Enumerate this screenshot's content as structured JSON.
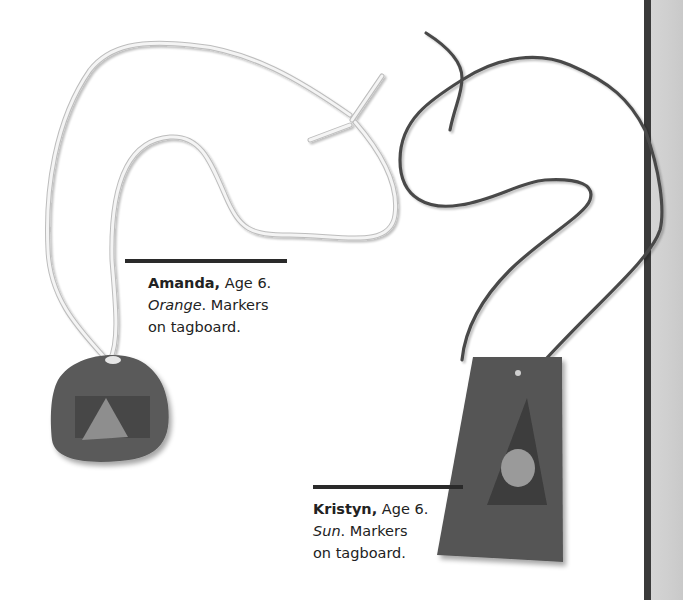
{
  "page": {
    "background": "#ffffff",
    "side_band_color": "#d0d0d0",
    "side_rule_color": "#3a3a3a"
  },
  "artworks": [
    {
      "id": "amanda",
      "description": "Round dark pendant with light triangle, on white string",
      "caption": {
        "name": "Amanda,",
        "age": " Age 6.",
        "title": "Orange",
        "after_title": ". Markers",
        "medium_line2": "on tagboard."
      }
    },
    {
      "id": "kristyn",
      "description": "Trapezoid dark pendant with dark triangle and light oval, on dark string",
      "caption": {
        "name": "Kristyn,",
        "age": " Age 6.",
        "title": "Sun",
        "after_title": ". Markers",
        "medium_line2": "on tagboard."
      }
    }
  ]
}
